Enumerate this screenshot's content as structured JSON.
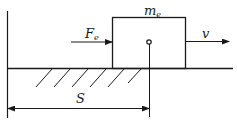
{
  "diagram": {
    "type": "physics-free-body",
    "labels": {
      "mass": {
        "main": "m",
        "sub": "e"
      },
      "force": {
        "main": "F",
        "sub": "e"
      },
      "velocity": "v",
      "distance": "S"
    },
    "colors": {
      "stroke": "#1a1a1a",
      "background": "#ffffff"
    }
  }
}
